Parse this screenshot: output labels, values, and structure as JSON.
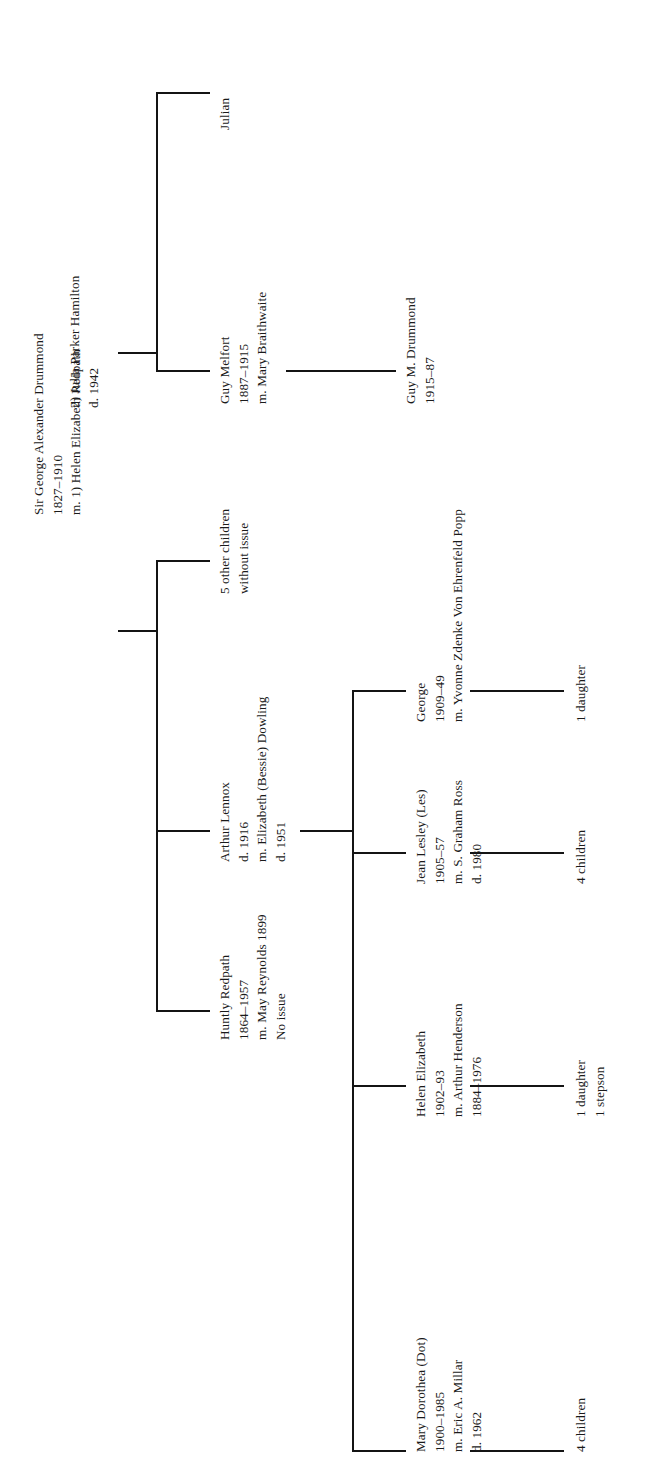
{
  "document": {
    "kind": "genealogy-chart",
    "orientation": "rotated-90-counterclockwise",
    "family": "Drummond"
  },
  "root": {
    "name": "Sir George Alexander Drummond",
    "dates": "1827–1910",
    "marriage1": "m. 1) Helen Elizabeth Redpath",
    "marriage2": "2) Julia Parker Hamilton",
    "marriage2_dates": "d. 1942"
  },
  "people": {
    "julian": {
      "name": "Julian"
    },
    "guy_melfort": {
      "name": "Guy Melfort",
      "dates": "1887–1915",
      "spouse": "m. Mary Braithwaite"
    },
    "guy_m_drummond": {
      "name": "Guy M. Drummond",
      "dates": "1915–87"
    },
    "other_children": {
      "line1": "5 other children",
      "line2": "without issue"
    },
    "arthur_lennox": {
      "name": "Arthur Lennox",
      "dates": "d. 1916",
      "spouse": "m. Elizabeth (Bessie) Dowling",
      "spouse_dates": "d. 1951"
    },
    "huntly_redpath": {
      "name": "Huntly Redpath",
      "dates": "1864–1957",
      "spouse": "m. May Reynolds 1899",
      "issue": "No issue"
    },
    "george": {
      "name": "George",
      "dates": "1909–49",
      "spouse": "m. Yvonne Zdenke Von Ehrenfeld Popp",
      "issue": "1 daughter"
    },
    "jean_lesley": {
      "name": "Jean Lesley (Les)",
      "dates": "1905–57",
      "spouse": "m. S. Graham Ross",
      "spouse_dates": "d. 1980",
      "issue": "4 children"
    },
    "helen_elizabeth": {
      "name": "Helen Elizabeth",
      "dates": "1902–93",
      "spouse": "m. Arthur Henderson",
      "spouse_dates": "1884–1976",
      "issue1": "1 daughter",
      "issue2": "1 stepson"
    },
    "mary_dorothea": {
      "name": "Mary Dorothea (Dot)",
      "dates": "1900–1985",
      "spouse": "m. Eric A. Millar",
      "spouse_dates": "d. 1962",
      "issue": "4 children"
    }
  },
  "style": {
    "ink": "#141414",
    "paper": "#ffffff"
  }
}
